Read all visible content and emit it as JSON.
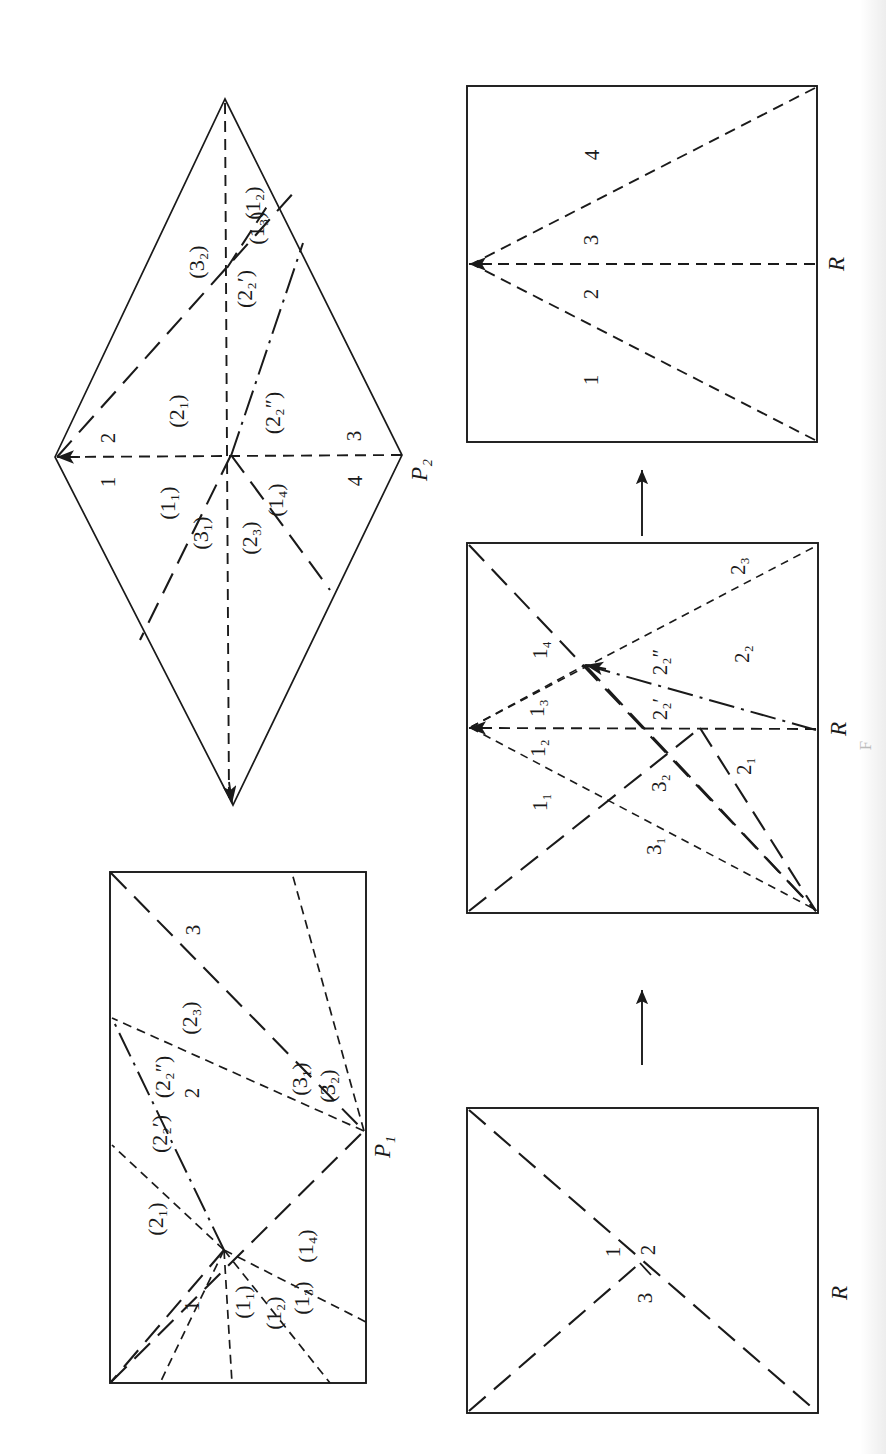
{
  "figure": {
    "orientation": "rotated-90-ccw",
    "background": "#ffffff",
    "ink": "#1a1a1a",
    "panel_count": 5
  },
  "panels": {
    "diamond_p2": {
      "name": "P2-diamond",
      "vertex_label": "P₂",
      "edge_numbers": [
        "1",
        "2",
        "3",
        "4"
      ],
      "region_labels": [
        "(1₁)",
        "(1₂)",
        "(1₃)",
        "(1₄)",
        "(2₁)",
        "(2₂′)",
        "(2₂″)",
        "(2₃)",
        "(3₁)",
        "(3₂)"
      ]
    },
    "rect_p1": {
      "name": "P1-rectangle",
      "vertex_label": "P₁",
      "edge_numbers": [
        "1",
        "2",
        "3"
      ],
      "region_labels": [
        "(1₁)",
        "(1₂)",
        "(1₃)",
        "(1₄)",
        "(2₁)",
        "(2₂′)",
        "(2₂″)",
        "(2₃)",
        "(3₁)",
        "(3₂)"
      ]
    },
    "rect_r_top": {
      "name": "R-top-rectangle",
      "vertex_label": "R",
      "region_labels": [
        "1",
        "2",
        "3",
        "4"
      ]
    },
    "rect_r_middle": {
      "name": "R-middle-rectangle",
      "vertex_label": "R",
      "region_labels": [
        "1₁",
        "1₂",
        "1₃",
        "1₄",
        "2₁",
        "2₂",
        "2₂′",
        "2₂″",
        "2₃",
        "3₁",
        "3₂"
      ]
    },
    "rect_r_bottom": {
      "name": "R-bottom-rectangle",
      "vertex_label": "R",
      "region_labels": [
        "1",
        "2",
        "3"
      ]
    }
  },
  "labels": {
    "P1": "P₁",
    "P2": "P₂",
    "R": "R",
    "n1": "1",
    "n2": "2",
    "n3": "3",
    "n4": "4",
    "p_1_1": "(1₁)",
    "p_1_2": "(1₂)",
    "p_1_3": "(1₃)",
    "p_1_4": "(1₄)",
    "p_2_1": "(2₁)",
    "p_2_2p": "(2₂′)",
    "p_2_2pp": "(2₂″)",
    "p_2_3": "(2₃)",
    "p_3_1": "(3₁)",
    "p_3_2": "(3₂)",
    "b_1_1": "1₁",
    "b_1_2": "1₂",
    "b_1_3": "1₃",
    "b_1_4": "1₄",
    "b_2_1": "2₁",
    "b_2_2": "2₂",
    "b_2_2p": "2₂′",
    "b_2_2pp": "2₂″",
    "b_2_3": "2₃",
    "b_3_1": "3₁",
    "b_3_2": "3₂"
  },
  "page_bleed": {
    "text": "F"
  }
}
